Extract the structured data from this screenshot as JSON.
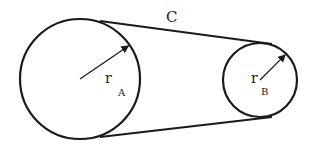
{
  "diagram": {
    "type": "belt-pulley",
    "stroke_color": "#1a1a1a",
    "background": "#ffffff",
    "pulley_a": {
      "cx": 80,
      "cy": 79,
      "r": 60,
      "radius_label": "r",
      "subscript": "A"
    },
    "pulley_b": {
      "cx": 260,
      "cy": 80,
      "r": 37,
      "radius_label": "r",
      "subscript": "B"
    },
    "belt": {
      "label": "C",
      "top": {
        "x1": 100,
        "y1": 21,
        "x2": 272,
        "y2": 44
      },
      "bottom": {
        "x1": 100,
        "y1": 137,
        "x2": 272,
        "y2": 117
      }
    }
  }
}
